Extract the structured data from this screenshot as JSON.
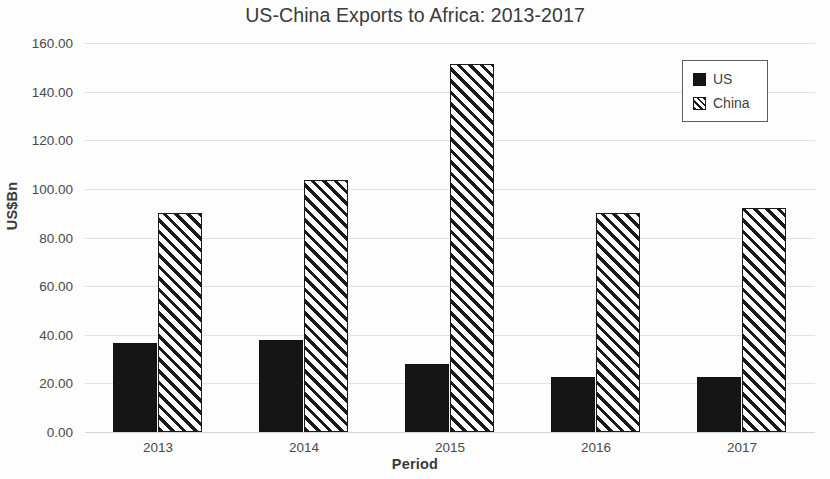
{
  "chart_data": {
    "type": "bar",
    "title": "US-China Exports to Africa: 2013-2017",
    "xlabel": "Period",
    "ylabel": "US$Bn",
    "categories": [
      "2013",
      "2014",
      "2015",
      "2016",
      "2017"
    ],
    "series": [
      {
        "name": "US",
        "values": [
          36.6,
          37.9,
          28.0,
          22.6,
          22.6
        ]
      },
      {
        "name": "China",
        "values": [
          90.0,
          103.7,
          151.4,
          90.0,
          92.0
        ]
      }
    ],
    "ylim": [
      0,
      160
    ],
    "ytick_step": 20,
    "ytick_labels": [
      "0.00",
      "20.00",
      "40.00",
      "60.00",
      "80.00",
      "100.00",
      "120.00",
      "140.00",
      "160.00"
    ],
    "ytick_values": [
      0,
      20,
      40,
      60,
      80,
      100,
      120,
      140,
      160
    ],
    "grid": true,
    "grid_axis": "y",
    "legend_position": "top-right",
    "series_styles": [
      {
        "name": "US",
        "fill": "solid",
        "color": "#151515"
      },
      {
        "name": "China",
        "fill": "diagonal-hatch",
        "color": "#1a1a1a"
      }
    ]
  },
  "legend": {
    "entries": [
      {
        "label": "US",
        "swatch": "solid-square-icon"
      },
      {
        "label": "China",
        "swatch": "hatched-square-icon"
      }
    ]
  }
}
